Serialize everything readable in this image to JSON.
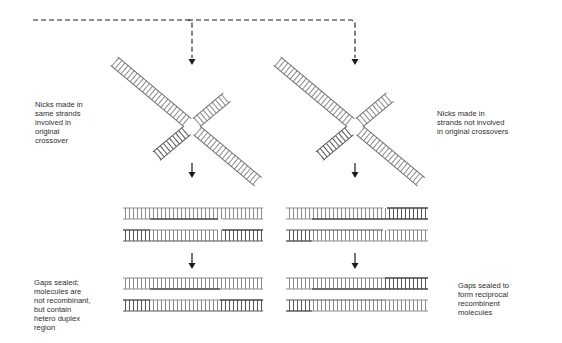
{
  "diagram": {
    "colors": {
      "background": "#ffffff",
      "strand_light": "#9a9a9a",
      "strand_dark": "#4a4a4a",
      "arrow": "#1a1a1a",
      "text": "#2e2e2e"
    },
    "labels": {
      "left_nicks": [
        "Nicks made in",
        "same strands",
        "involved in",
        "original",
        "crossover"
      ],
      "right_nicks": [
        "Nicks made in",
        "strands not involved",
        "in original crossovers"
      ],
      "left_result": [
        "Gaps sealed;",
        "molecules are",
        "not recombinant,",
        "but contain",
        "hetero duplex",
        "region"
      ],
      "right_result": [
        "Gaps sealed to",
        "form reciprocal",
        "recombinent",
        "molecules"
      ]
    },
    "pathways": [
      {
        "name": "left",
        "crossover_center": [
          192,
          127
        ],
        "nicked_duplexes_y": [
          213,
          235
        ],
        "sealed_duplexes_y": [
          283,
          305
        ],
        "x_range": [
          123,
          263
        ],
        "patch_range": [
          150,
          220
        ]
      },
      {
        "name": "right",
        "crossover_center": [
          355,
          127
        ],
        "nicked_duplexes_y": [
          213,
          235
        ],
        "sealed_duplexes_y": [
          283,
          305
        ],
        "x_range": [
          286,
          428
        ],
        "patch_range": [
          312,
          385
        ]
      }
    ]
  }
}
